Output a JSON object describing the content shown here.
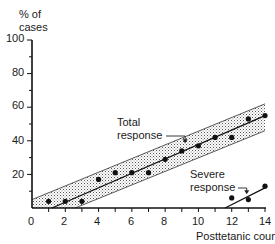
{
  "chart_data": {
    "type": "scatter",
    "title": "",
    "xlabel": "Posttetanic count",
    "ylabel": "% of cases",
    "xlim": [
      0,
      14
    ],
    "ylim": [
      0,
      100
    ],
    "x_ticks": [
      0,
      2,
      4,
      6,
      8,
      10,
      12,
      14
    ],
    "y_ticks": [
      20,
      40,
      60,
      80,
      100
    ],
    "x_minor_ticks": [
      1,
      3,
      5,
      7,
      9,
      11,
      13
    ],
    "y_minor_ticks": [
      10,
      30,
      50,
      70,
      90
    ],
    "grid": false,
    "series": [
      {
        "name": "Total response",
        "x": [
          1,
          2,
          3,
          4,
          5,
          6,
          7,
          8,
          9,
          10,
          11,
          12,
          13,
          14
        ],
        "y": [
          4,
          4,
          4,
          17,
          21,
          21,
          21,
          29,
          34,
          37,
          42,
          42,
          53,
          55
        ],
        "fit_line": {
          "x": [
            1.2,
            14
          ],
          "y": [
            0,
            55
          ]
        },
        "confidence_band": {
          "upper": {
            "x": [
              0,
              14
            ],
            "y": [
              5,
              62
            ]
          },
          "lower": {
            "x": [
              2.6,
              14
            ],
            "y": [
              0,
              46
            ]
          }
        }
      },
      {
        "name": "Severe response",
        "x": [
          12,
          13,
          14
        ],
        "y": [
          6,
          5,
          13
        ],
        "fit_line": {
          "x": [
            11.6,
            14
          ],
          "y": [
            0,
            12
          ]
        }
      }
    ],
    "annotations": [
      {
        "text": "Total response",
        "arrow_to": {
          "x": 9.2,
          "y": 38
        }
      },
      {
        "text": "Severe response",
        "arrow_to": {
          "x": 12.9,
          "y": 7
        }
      }
    ]
  },
  "labels": {
    "ylabel_line1": "% of",
    "ylabel_line2": "cases",
    "xlabel": "Posttetanic count",
    "total_line1": "Total",
    "total_line2": "response",
    "severe_line1": "Severe",
    "severe_line2": "response",
    "y_tick_100": "100",
    "y_tick_80": "80",
    "y_tick_60": "60",
    "y_tick_40": "40",
    "y_tick_20": "20",
    "x_tick_0": "0",
    "x_tick_2": "2",
    "x_tick_4": "4",
    "x_tick_6": "6",
    "x_tick_8": "8",
    "x_tick_10": "10",
    "x_tick_12": "12",
    "x_tick_14": "14"
  }
}
